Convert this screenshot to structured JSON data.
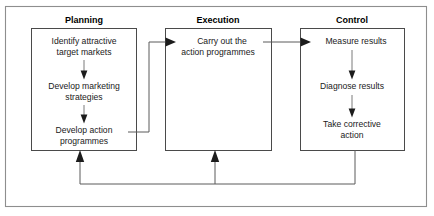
{
  "diagram": {
    "title_planning": "Planning",
    "title_execution": "Execution",
    "title_control": "Control",
    "colors": {
      "frame": "#8e8e8e",
      "box_border": "#4a4a4a",
      "connector": "#5a5a5a",
      "arrow": "#1c1c1c",
      "text": "#1a1a1a",
      "background": "#ffffff"
    },
    "columns": [
      {
        "id": "planning",
        "label": "Planning",
        "nodes": [
          {
            "id": "identify-markets",
            "lines": [
              "Identify attractive",
              "target markets"
            ]
          },
          {
            "id": "develop-marketing-strategies",
            "lines": [
              "Develop marketing",
              "strategies"
            ]
          },
          {
            "id": "develop-action-programmes",
            "lines": [
              "Develop action",
              "programmes"
            ]
          }
        ]
      },
      {
        "id": "execution",
        "label": "Execution",
        "nodes": [
          {
            "id": "carry-out-action-programmes",
            "lines": [
              "Carry out the",
              "action programmes"
            ]
          }
        ]
      },
      {
        "id": "control",
        "label": "Control",
        "nodes": [
          {
            "id": "measure-results",
            "lines": [
              "Measure results"
            ]
          },
          {
            "id": "diagnose-results",
            "lines": [
              "Diagnose results"
            ]
          },
          {
            "id": "take-corrective-action",
            "lines": [
              "Take corrective",
              "action"
            ]
          }
        ]
      }
    ],
    "flows": [
      {
        "id": "planning-to-execution",
        "from": "develop-action-programmes",
        "to": "carry-out-action-programmes"
      },
      {
        "id": "execution-to-control",
        "from": "carry-out-action-programmes",
        "to": "measure-results"
      },
      {
        "id": "identify-to-strategies",
        "from": "identify-markets",
        "to": "develop-marketing-strategies"
      },
      {
        "id": "strategies-to-action",
        "from": "develop-marketing-strategies",
        "to": "develop-action-programmes"
      },
      {
        "id": "measure-to-diagnose",
        "from": "measure-results",
        "to": "diagnose-results"
      },
      {
        "id": "diagnose-to-corrective",
        "from": "diagnose-results",
        "to": "take-corrective-action"
      },
      {
        "id": "feedback-to-planning",
        "from": "take-corrective-action",
        "to": "planning"
      },
      {
        "id": "feedback-to-execution",
        "from": "take-corrective-action",
        "to": "execution"
      }
    ]
  }
}
